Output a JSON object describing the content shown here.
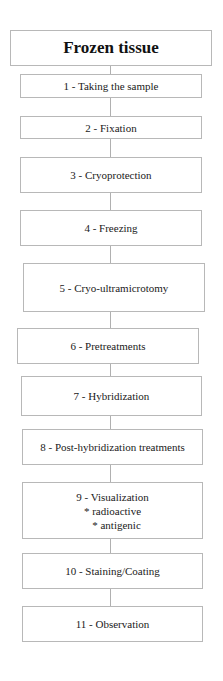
{
  "diagram": {
    "title": "Frozen tissue",
    "steps": [
      {
        "label": "1 - Taking the sample"
      },
      {
        "label": "2 - Fixation"
      },
      {
        "label": "3 - Cryoprotection"
      },
      {
        "label": "4 - Freezing"
      },
      {
        "label": "5 - Cryo-ultramicrotomy"
      },
      {
        "label": "6 - Pretreatments"
      },
      {
        "label": "7 - Hybridization"
      },
      {
        "label": "8 - Post-hybridization treatments"
      },
      {
        "label": "9 - Visualization",
        "sub_items": [
          "* radioactive",
          "* antigenic"
        ]
      },
      {
        "label": "10 - Staining/Coating"
      },
      {
        "label": "11 - Observation"
      }
    ],
    "colors": {
      "border": "#b8b8b8",
      "connector": "#b0b0b0",
      "text": "#1a1a1a",
      "background": "#ffffff"
    }
  }
}
